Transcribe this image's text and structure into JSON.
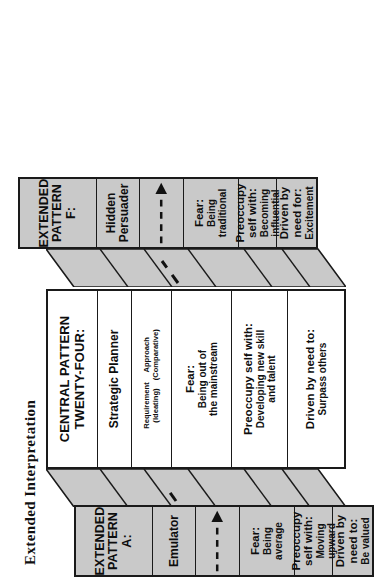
{
  "title": "Extended Interpretation",
  "colors": {
    "panel_gray": "#c9c9c9",
    "panel_white": "#ffffff",
    "outline": "#1a1a1a",
    "text": "#0d0d0d"
  },
  "panels": [
    {
      "id": "pattern-a",
      "header_line1": "EXTENDED",
      "header_line2": "PATTERN  A:",
      "role": "Emulator",
      "arrow": "dashed-arrow-right",
      "rows": [
        {
          "label": "Fear:",
          "value": "Being average"
        },
        {
          "label": "Preoccupy self with:",
          "value": "Moving upward"
        },
        {
          "label": "Driven by need to:",
          "value": "Be valued"
        }
      ],
      "fill": "gray"
    },
    {
      "id": "central-pattern-twenty-four",
      "header_line1": "CENTRAL PATTERN",
      "header_line2": "TWENTY-FOUR:",
      "role": "Strategic Planner",
      "requirement_label": "Requirement",
      "requirement_value": "(Ideating)",
      "approach_label": "Approach",
      "approach_value": "(Comparative)",
      "rows": [
        {
          "label": "Fear:",
          "value": "Being out of\nthe mainstream"
        },
        {
          "label": "Preoccupy self with:",
          "value": "Developing new skill\nand talent"
        },
        {
          "label": "Driven by need to:",
          "value": "Surpass others"
        }
      ],
      "fill": "white"
    },
    {
      "id": "pattern-f",
      "header_line1": "EXTENDED",
      "header_line2": "PATTERN F:",
      "role": "Hidden Persuader",
      "arrow": "dashed-arrow-right",
      "rows": [
        {
          "label": "Fear:",
          "value": "Being traditional"
        },
        {
          "label": "Preoccupy self with:",
          "value": "Becoming influential"
        },
        {
          "label": "Driven by need for:",
          "value": "Excitement"
        }
      ],
      "fill": "gray"
    }
  ]
}
